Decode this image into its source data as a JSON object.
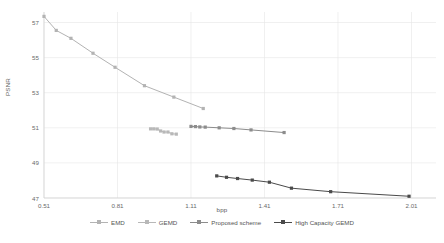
{
  "chart_data": {
    "type": "line",
    "title": "",
    "xlabel": "bpp",
    "ylabel": "PSNR",
    "xlim": [
      0.51,
      2.11
    ],
    "ylim": [
      47,
      57.6
    ],
    "xticks": [
      "0.51",
      "0.81",
      "1.11",
      "1.41",
      "1.71",
      "2.01"
    ],
    "xtick_values": [
      0.51,
      0.81,
      1.11,
      1.41,
      1.71,
      2.01
    ],
    "yticks": [
      "47",
      "49",
      "51",
      "53",
      "55",
      "57"
    ],
    "ytick_values": [
      47,
      49,
      51,
      53,
      55,
      57
    ],
    "grid": true,
    "legend_position": "bottom",
    "series": [
      {
        "name": "EMD",
        "color": "#b3b3b3",
        "marker": "square",
        "x": [
          0.51,
          0.56,
          0.62,
          0.71,
          0.8,
          0.92,
          1.04,
          1.16
        ],
        "y": [
          57.35,
          56.55,
          56.1,
          55.25,
          54.45,
          53.4,
          52.75,
          52.1
        ]
      },
      {
        "name": "GEMD",
        "color": "#b8b8b8",
        "marker": "square",
        "x": [
          0.945,
          0.958,
          0.972,
          0.986,
          1.0,
          1.016,
          1.032,
          1.05
        ],
        "y": [
          50.94,
          50.94,
          50.93,
          50.82,
          50.76,
          50.76,
          50.66,
          50.64
        ]
      },
      {
        "name": "Proposed scheme",
        "color": "#8c8c8c",
        "marker": "square",
        "x": [
          1.11,
          1.128,
          1.146,
          1.168,
          1.225,
          1.285,
          1.355,
          1.49
        ],
        "y": [
          51.08,
          51.07,
          51.05,
          51.04,
          51.0,
          50.96,
          50.88,
          50.73
        ]
      },
      {
        "name": "High Capacity GEMD",
        "color": "#4a4a4a",
        "marker": "square",
        "x": [
          1.215,
          1.255,
          1.3,
          1.36,
          1.43,
          1.52,
          1.68,
          2.0
        ],
        "y": [
          48.26,
          48.18,
          48.11,
          48.02,
          47.9,
          47.56,
          47.36,
          47.1
        ]
      }
    ]
  },
  "legend": {
    "items": [
      {
        "label": "EMD"
      },
      {
        "label": "GEMD"
      },
      {
        "label": "Proposed scheme"
      },
      {
        "label": "High Capacity GEMD"
      }
    ]
  }
}
